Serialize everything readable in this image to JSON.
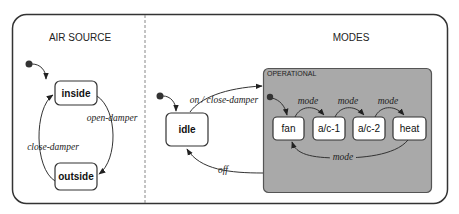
{
  "regions": {
    "air_source": {
      "label": "AIR SOURCE"
    },
    "modes": {
      "label": "MODES"
    }
  },
  "composite_state": {
    "label": "OPERATIONAL",
    "fill": "#a9a9a9"
  },
  "states": {
    "inside": "inside",
    "outside": "outside",
    "idle": "idle",
    "fan": "fan",
    "ac1": "a/c-1",
    "ac2": "a/c-2",
    "heat": "heat"
  },
  "transitions": {
    "open_damper": "open-damper",
    "close_damper": "close-damper",
    "on_close_damper": "on / close-damper",
    "off": "off",
    "mode_fan_ac1": "mode",
    "mode_ac1_ac2": "mode",
    "mode_ac2_heat": "mode",
    "mode_heat_fan": "mode"
  }
}
